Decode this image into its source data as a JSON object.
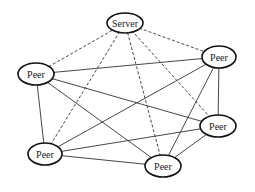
{
  "diagram": {
    "type": "network-topology",
    "nodes": [
      {
        "id": "server",
        "label": "Server",
        "cx": 125,
        "cy": 23,
        "rx": 18,
        "ry": 10
      },
      {
        "id": "peer_left",
        "label": "Peer",
        "cx": 36,
        "cy": 74,
        "rx": 18,
        "ry": 11
      },
      {
        "id": "peer_top_right",
        "label": "Peer",
        "cx": 219,
        "cy": 57,
        "rx": 17,
        "ry": 11
      },
      {
        "id": "peer_right",
        "label": "Peer",
        "cx": 218,
        "cy": 126,
        "rx": 18,
        "ry": 11
      },
      {
        "id": "peer_bottom_left",
        "label": "Peer",
        "cx": 45,
        "cy": 154,
        "rx": 17,
        "ry": 11
      },
      {
        "id": "peer_bottom",
        "label": "Peer",
        "cx": 163,
        "cy": 166,
        "rx": 18,
        "ry": 11
      }
    ],
    "edges": [
      {
        "from": "server",
        "to": "peer_left",
        "style": "dashed"
      },
      {
        "from": "server",
        "to": "peer_top_right",
        "style": "dashed"
      },
      {
        "from": "server",
        "to": "peer_right",
        "style": "dashed"
      },
      {
        "from": "server",
        "to": "peer_bottom_left",
        "style": "dashed"
      },
      {
        "from": "server",
        "to": "peer_bottom",
        "style": "dashed"
      },
      {
        "from": "peer_left",
        "to": "peer_top_right",
        "style": "solid"
      },
      {
        "from": "peer_left",
        "to": "peer_right",
        "style": "solid"
      },
      {
        "from": "peer_left",
        "to": "peer_bottom",
        "style": "solid"
      },
      {
        "from": "peer_left",
        "to": "peer_bottom_left",
        "style": "solid"
      },
      {
        "from": "peer_top_right",
        "to": "peer_right",
        "style": "solid"
      },
      {
        "from": "peer_top_right",
        "to": "peer_bottom_left",
        "style": "solid"
      },
      {
        "from": "peer_top_right",
        "to": "peer_bottom",
        "style": "solid"
      },
      {
        "from": "peer_right",
        "to": "peer_bottom_left",
        "style": "solid"
      },
      {
        "from": "peer_right",
        "to": "peer_bottom",
        "style": "solid"
      },
      {
        "from": "peer_bottom_left",
        "to": "peer_bottom",
        "style": "solid"
      }
    ]
  }
}
